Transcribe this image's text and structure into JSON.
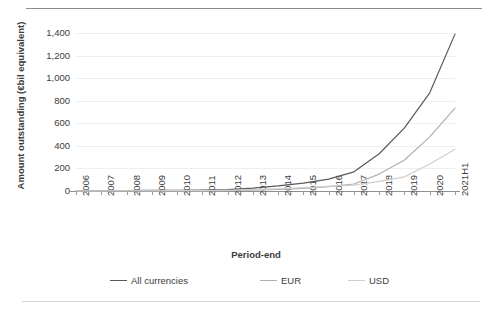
{
  "caption": {
    "clipped_text": " "
  },
  "chart_data": {
    "type": "line",
    "title": "",
    "xlabel": "Period-end",
    "ylabel": "Amount outstanding (€bil equivalent)",
    "categories": [
      "2006",
      "2007",
      "2008",
      "2009",
      "2010",
      "2011",
      "2012",
      "2013",
      "2014",
      "2015",
      "2016",
      "2017",
      "2018",
      "2019",
      "2020",
      "2021H1"
    ],
    "ylim": [
      0,
      1400
    ],
    "yticks": [
      0,
      200,
      400,
      600,
      800,
      1000,
      1200,
      1400
    ],
    "ytick_labels": [
      "0",
      "200",
      "400",
      "600",
      "800",
      "1,000",
      "1,200",
      "1,400"
    ],
    "grid": true,
    "legend_position": "bottom",
    "series": [
      {
        "name": "All currencies",
        "color": "#595959",
        "values": [
          2,
          3,
          4,
          5,
          6,
          8,
          12,
          26,
          45,
          70,
          105,
          170,
          330,
          560,
          870,
          1390
        ]
      },
      {
        "name": "EUR",
        "color": "#b0b0b0",
        "values": [
          0,
          0,
          1,
          1,
          2,
          3,
          4,
          8,
          14,
          24,
          38,
          62,
          150,
          275,
          480,
          735
        ]
      },
      {
        "name": "USD",
        "color": "#cfcfcf",
        "values": [
          1,
          1,
          2,
          2,
          3,
          4,
          6,
          12,
          20,
          30,
          42,
          52,
          85,
          125,
          240,
          370
        ]
      }
    ]
  },
  "legend": {
    "items": [
      {
        "label": "All currencies",
        "color": "#595959"
      },
      {
        "label": "EUR",
        "color": "#b0b0b0"
      },
      {
        "label": "USD",
        "color": "#cfcfcf"
      }
    ]
  }
}
